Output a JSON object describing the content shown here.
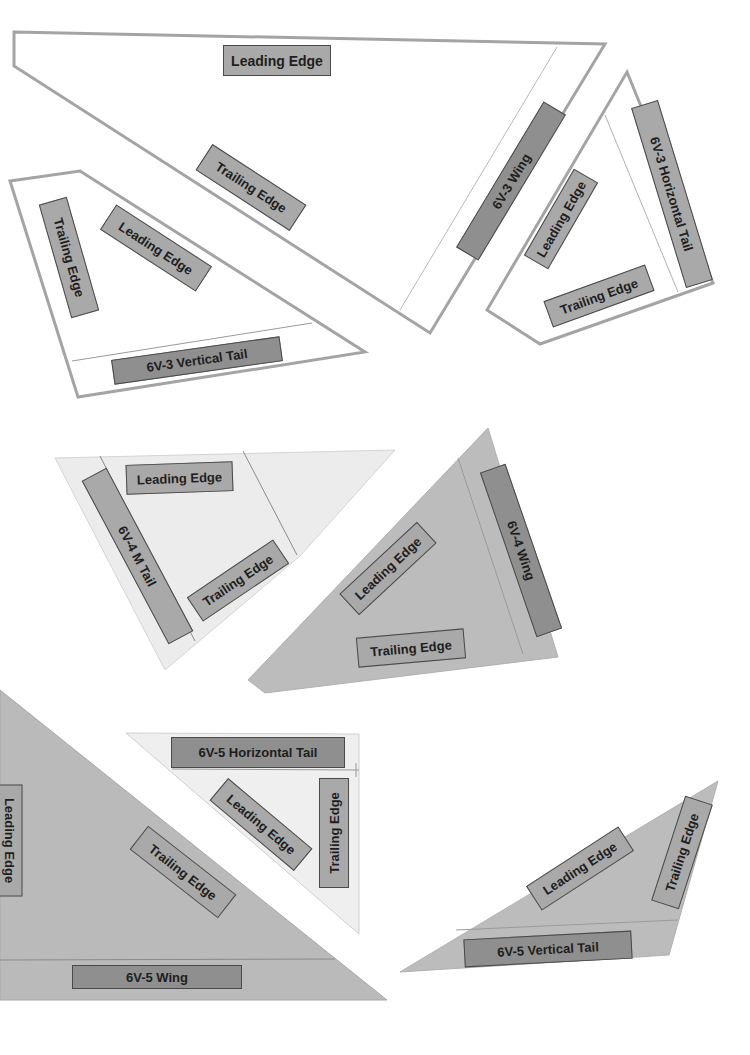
{
  "pieces": {
    "6v3_wing": {
      "name": "6V-3 Wing",
      "leading_edge": "Leading Edge",
      "trailing_edge": "Trailing Edge"
    },
    "6v3_vertical_tail": {
      "name": "6V-3 Vertical Tail",
      "leading_edge": "Leading Edge",
      "trailing_edge": "Trailing Edge"
    },
    "6v3_horizontal_tail": {
      "name": "6V-3 Horizontal Tail",
      "leading_edge": "Leading Edge",
      "trailing_edge": "Trailing Edge"
    },
    "6v4_m_tail": {
      "name": "6V-4 M Tail",
      "leading_edge": "Leading Edge",
      "trailing_edge": "Trailing Edge"
    },
    "6v4_wing": {
      "name": "6V-4 Wing",
      "leading_edge": "Leading Edge",
      "trailing_edge": "Trailing Edge"
    },
    "6v5_wing": {
      "name": "6V-5 Wing",
      "leading_edge": "Leading Edge",
      "trailing_edge": "Trailing Edge"
    },
    "6v5_horizontal_tail": {
      "name": "6V-5 Horizontal Tail",
      "leading_edge": "Leading Edge",
      "trailing_edge": "Trailing Edge"
    },
    "6v5_vertical_tail": {
      "name": "6V-5 Vertical Tail",
      "leading_edge": "Leading Edge",
      "trailing_edge": "Trailing Edge"
    }
  },
  "colors": {
    "outline": "#a0a0a0",
    "label_fill": "#a9a9a9",
    "label_dark_fill": "#8f8f8f",
    "label_border": "#4a4a4a",
    "light_piece": "#ebebeb",
    "gray_piece": "#b9b9b9"
  }
}
